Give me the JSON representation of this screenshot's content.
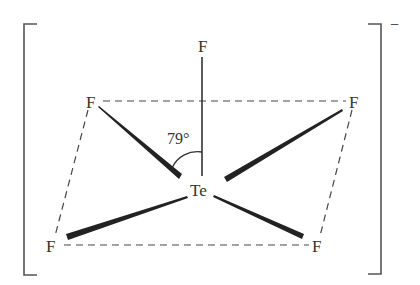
{
  "diagram": {
    "central_atom": "Te",
    "ligands": {
      "axial": "F",
      "upper_left": "F",
      "upper_right": "F",
      "lower_left": "F",
      "lower_right": "F"
    },
    "angle": {
      "label": "79°",
      "between": [
        "F axial",
        "F upper_left"
      ]
    },
    "charge": "−",
    "colors": {
      "ink": "#333333",
      "background": "#ffffff"
    }
  }
}
